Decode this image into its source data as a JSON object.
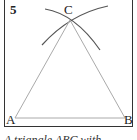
{
  "figure": {
    "step_number": "5",
    "points": {
      "A": {
        "label": "A",
        "x": 15,
        "y": 118
      },
      "B": {
        "label": "B",
        "x": 125,
        "y": 118
      },
      "C": {
        "label": "C",
        "x": 70,
        "y": 20
      }
    },
    "caption": "A triangle ABC with ..."
  },
  "colors": {
    "frame": "#333333",
    "arc": "#555555",
    "side": "#aaaaaa"
  }
}
